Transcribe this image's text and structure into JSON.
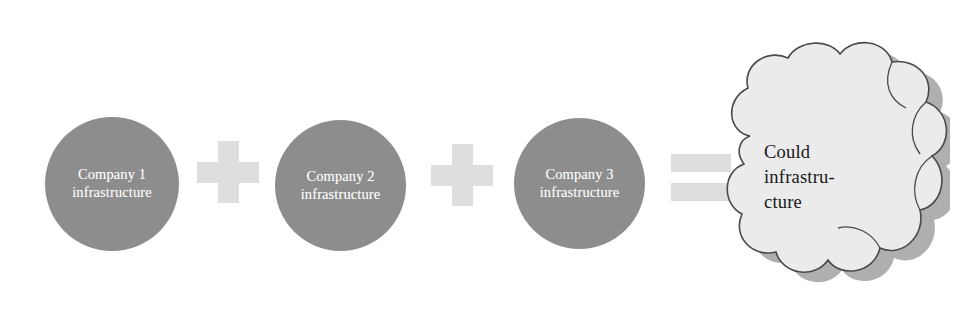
{
  "diagram": {
    "background_color": "#ffffff",
    "colors": {
      "circle_fill": "#8d8d8d",
      "circle_text": "#ffffff",
      "operator_fill": "#dedede",
      "cloud_fill": "#ebebeb",
      "cloud_outline": "#4a4a4a",
      "cloud_shadow": "#a8a8a8",
      "cloud_text": "#181818"
    },
    "nodes": [
      {
        "id": "company-1",
        "shape": "circle",
        "line1": "Company 1",
        "line2": "infrastructure"
      },
      {
        "id": "company-2",
        "shape": "circle",
        "line1": "Company 2",
        "line2": "infrastructure"
      },
      {
        "id": "company-3",
        "shape": "circle",
        "line1": "Company 3",
        "line2": "infrastructure"
      }
    ],
    "operators": [
      {
        "id": "plus-1",
        "symbol": "+",
        "name": "plus"
      },
      {
        "id": "plus-2",
        "symbol": "+",
        "name": "plus"
      },
      {
        "id": "equals-1",
        "symbol": "=",
        "name": "equals"
      }
    ],
    "result": {
      "id": "cloud",
      "shape": "cloud",
      "line1": "Could",
      "line2": "infrastru-",
      "line3": "cture"
    }
  }
}
